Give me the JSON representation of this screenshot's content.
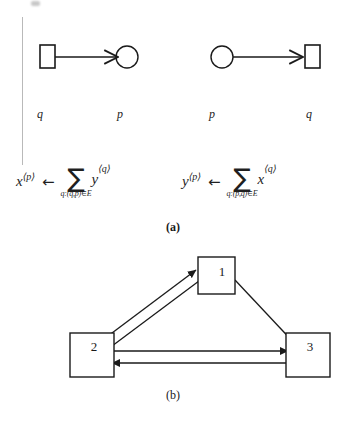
{
  "figure": {
    "panel_a": {
      "caption": "(a)",
      "left_diagram": {
        "source_label": "q",
        "target_label": "p",
        "source_shape": "square",
        "target_shape": "circle",
        "edge_direction": "square-to-circle"
      },
      "right_diagram": {
        "source_label": "p",
        "target_label": "q",
        "source_shape": "circle",
        "target_shape": "square",
        "edge_direction": "circle-to-square"
      },
      "formula_left": {
        "lhs_var": "x",
        "lhs_sup": "⟨p⟩",
        "arrow": "←",
        "sum_sign": "∑",
        "sum_subscript": "q:(q,p)∈E",
        "operand_var": "y",
        "operand_sup": "⟨q⟩"
      },
      "formula_right": {
        "lhs_var": "y",
        "lhs_sup": "⟨p⟩",
        "arrow": "←",
        "sum_sign": "∑",
        "sum_subscript": "q:(p,q)∈E",
        "operand_var": "x",
        "operand_sup": "⟨q⟩"
      }
    },
    "panel_b": {
      "caption": "(b)",
      "nodes": [
        {
          "id": "1",
          "label": "1"
        },
        {
          "id": "2",
          "label": "2"
        },
        {
          "id": "3",
          "label": "3"
        }
      ],
      "edges": [
        {
          "from": "1",
          "to": "2"
        },
        {
          "from": "2",
          "to": "1"
        },
        {
          "from": "1",
          "to": "3"
        },
        {
          "from": "2",
          "to": "3"
        },
        {
          "from": "3",
          "to": "2"
        }
      ]
    }
  },
  "style": {
    "ink": "#1a1a1a",
    "rule": "#b9b9b9",
    "background": "#ffffff"
  }
}
